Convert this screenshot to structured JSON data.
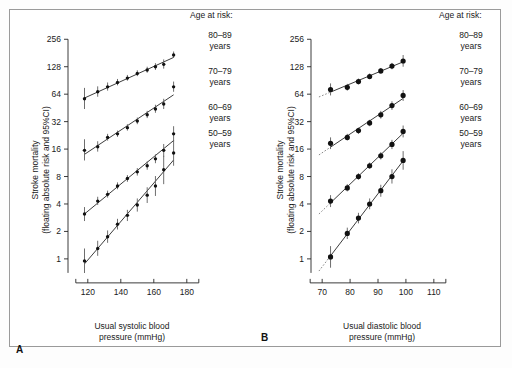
{
  "figure": {
    "panels": [
      {
        "id": "A",
        "label": "A",
        "xlabel_line1": "Usual systolic blood",
        "xlabel_line2": "pressure (mmHg)",
        "ylabel_line1": "Stroke mortality",
        "ylabel_line2": "(floating absolute risk and 95%CI)",
        "legend_title": "Age at risk:",
        "legend_items": [
          {
            "range": "80–89",
            "unit": "years"
          },
          {
            "range": "70–79",
            "unit": "years"
          },
          {
            "range": "60–69",
            "unit": "years"
          },
          {
            "range": "50–59",
            "unit": "years"
          }
        ]
      },
      {
        "id": "B",
        "label": "B",
        "xlabel_line1": "Usual diastolic blood",
        "xlabel_line2": "pressure (mmHg)",
        "ylabel_line1": "Stroke mortality",
        "ylabel_line2": "(floating absolute risk and 95%CI)",
        "legend_title": "Age at risk:",
        "legend_items": [
          {
            "range": "80–89",
            "unit": "years"
          },
          {
            "range": "70–79",
            "unit": "years"
          },
          {
            "range": "60–69",
            "unit": "years"
          },
          {
            "range": "50–59",
            "unit": "years"
          }
        ]
      }
    ]
  },
  "chart_data": [
    {
      "type": "scatter",
      "panel": "A",
      "title": "",
      "xlabel": "Usual systolic blood pressure (mmHg)",
      "ylabel": "Stroke mortality (floating absolute risk and 95%CI)",
      "xlim": [
        108,
        188
      ],
      "ylim": [
        0.7,
        300
      ],
      "yscale": "log2",
      "xticks": [
        120,
        140,
        160,
        180
      ],
      "yticks": [
        1,
        2,
        4,
        8,
        16,
        32,
        64,
        128,
        256
      ],
      "grid": false,
      "legend_position": "right",
      "legend_title": "Age at risk:",
      "series": [
        {
          "name": "80–89 years",
          "x": [
            118,
            126,
            132,
            138,
            144,
            150,
            156,
            161,
            166,
            172
          ],
          "y": [
            57,
            68,
            77,
            86,
            96,
            108,
            118,
            128,
            136,
            172
          ],
          "ci_low": [
            44,
            60,
            70,
            80,
            90,
            101,
            110,
            118,
            122,
            160
          ],
          "ci_high": [
            75,
            78,
            86,
            94,
            104,
            117,
            128,
            140,
            154,
            188
          ]
        },
        {
          "name": "70–79 years",
          "x": [
            118,
            126,
            132,
            138,
            144,
            150,
            156,
            161,
            166,
            172
          ],
          "y": [
            15.5,
            17.0,
            21.5,
            23.5,
            27.5,
            32.5,
            38.0,
            44.0,
            50.0,
            77.0
          ],
          "ci_low": [
            12.0,
            15.0,
            19.8,
            21.8,
            25.5,
            30.0,
            35.0,
            40.0,
            44.0,
            68.0
          ],
          "ci_high": [
            20.5,
            19.5,
            23.5,
            25.5,
            30.0,
            35.5,
            42.0,
            49.0,
            57.0,
            88.0
          ]
        },
        {
          "name": "60–69 years",
          "x": [
            118,
            126,
            132,
            138,
            144,
            150,
            156,
            161,
            166,
            172
          ],
          "y": [
            3.1,
            4.3,
            5.1,
            6.3,
            7.6,
            9.0,
            10.5,
            12.5,
            15.5,
            23.5
          ],
          "ci_low": [
            2.6,
            3.9,
            4.7,
            5.8,
            7.0,
            8.2,
            9.5,
            11.2,
            13.2,
            19.5
          ],
          "ci_high": [
            3.7,
            4.8,
            5.6,
            6.9,
            8.3,
            9.9,
            11.7,
            14.0,
            18.2,
            28.5
          ]
        },
        {
          "name": "50–59 years",
          "x": [
            118,
            126,
            132,
            138,
            144,
            150,
            156,
            161,
            166,
            172
          ],
          "y": [
            0.95,
            1.3,
            1.75,
            2.4,
            3.0,
            3.9,
            5.0,
            6.3,
            9.5,
            14.5
          ],
          "ci_low": [
            0.7,
            1.08,
            1.5,
            2.1,
            2.6,
            3.3,
            4.1,
            4.9,
            6.6,
            10.5
          ],
          "ci_high": [
            1.3,
            1.58,
            2.05,
            2.75,
            3.45,
            4.6,
            6.1,
            8.1,
            13.5,
            20.0
          ]
        }
      ]
    },
    {
      "type": "scatter",
      "panel": "B",
      "title": "",
      "xlabel": "Usual diastolic blood pressure (mmHg)",
      "ylabel": "Stroke mortality (floating absolute risk and 95%CI)",
      "xlim": [
        66,
        114
      ],
      "ylim": [
        0.7,
        300
      ],
      "yscale": "log2",
      "xticks": [
        70,
        80,
        90,
        100,
        110
      ],
      "yticks": [
        1,
        2,
        4,
        8,
        16,
        32,
        64,
        128,
        256
      ],
      "grid": false,
      "legend_position": "right",
      "legend_title": "Age at risk:",
      "series": [
        {
          "name": "80–89 years",
          "x": [
            73,
            79,
            83,
            87,
            91,
            95,
            99
          ],
          "y": [
            72,
            76,
            88,
            100,
            115,
            130,
            148
          ],
          "ci_low": [
            62,
            70,
            82,
            93,
            107,
            120,
            128
          ],
          "ci_high": [
            84,
            83,
            95,
            108,
            124,
            141,
            172
          ],
          "dotted_extension": true
        },
        {
          "name": "70–79 years",
          "x": [
            73,
            79,
            83,
            87,
            91,
            95,
            99
          ],
          "y": [
            18.5,
            21.5,
            25.5,
            31.0,
            38.0,
            48.0,
            62.0
          ],
          "ci_low": [
            16.0,
            19.8,
            23.5,
            28.5,
            34.5,
            43.0,
            54.0
          ],
          "ci_high": [
            21.5,
            23.5,
            27.5,
            33.5,
            42.0,
            53.5,
            71.0
          ],
          "dotted_extension": true
        },
        {
          "name": "60–69 years",
          "x": [
            73,
            79,
            83,
            87,
            91,
            95,
            99
          ],
          "y": [
            4.3,
            6.0,
            8.0,
            10.5,
            13.5,
            18.0,
            25.0
          ],
          "ci_low": [
            3.7,
            5.5,
            7.4,
            9.7,
            12.3,
            16.0,
            21.5
          ],
          "ci_high": [
            5.0,
            6.6,
            8.7,
            11.4,
            14.8,
            20.2,
            29.0
          ],
          "dotted_extension": true
        },
        {
          "name": "50–59 years",
          "x": [
            73,
            79,
            83,
            87,
            91,
            95,
            99
          ],
          "y": [
            1.05,
            1.9,
            2.8,
            4.0,
            5.6,
            8.0,
            12.0
          ],
          "ci_low": [
            0.8,
            1.65,
            2.45,
            3.5,
            4.8,
            6.7,
            9.5
          ],
          "ci_high": [
            1.38,
            2.2,
            3.2,
            4.6,
            6.5,
            9.6,
            15.2
          ],
          "dotted_extension": true
        }
      ]
    }
  ]
}
